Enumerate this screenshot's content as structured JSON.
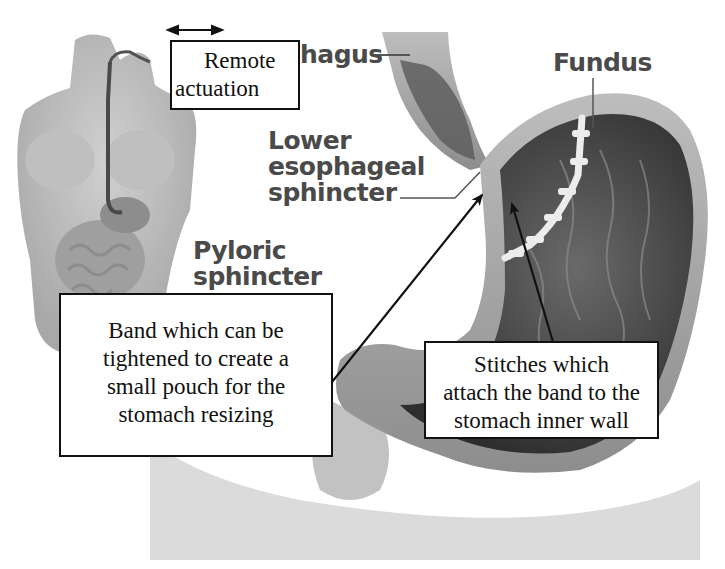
{
  "figure": {
    "type": "medical-diagram"
  },
  "anatomy_labels": {
    "esophagus": "hagus",
    "fundus": "Fundus",
    "les_line1": "Lower",
    "les_line2": "esophageal",
    "les_line3": "sphincter",
    "pyloric_line1": "Pyloric",
    "pyloric_line2": "sphincter"
  },
  "callouts": {
    "remote": {
      "line1": "Remote",
      "line2": "actuation"
    },
    "band": {
      "line1": "Band which can be",
      "line2": "tightened to create a",
      "line3": "small pouch for the",
      "line4": "stomach resizing"
    },
    "stitches": {
      "line1": "Stitches which",
      "line2": "attach the band to the",
      "line3": "stomach inner wall"
    }
  },
  "colors": {
    "label_gray": "#4a4a4a",
    "callout_border": "#111111",
    "tissue_light": "#b8b8b8",
    "tissue_dark": "#3a3a3a",
    "stitch": "#e8e8e8"
  }
}
